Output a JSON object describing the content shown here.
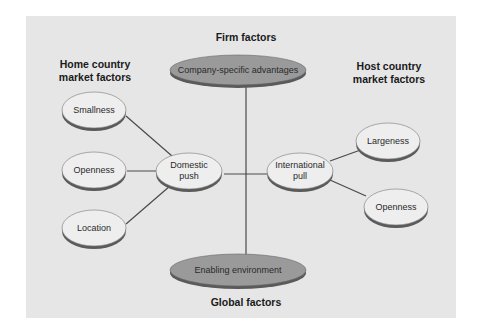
{
  "diagram": {
    "panel_color": "#e6e6e6",
    "light_node_fill": "#eeeeee",
    "dark_node_fill": "#9a9a9a",
    "shadow_color": "#5a5a5a",
    "line_color": "#4a4a4a",
    "titles": {
      "firm": "Firm factors",
      "home_line1": "Home country",
      "home_line2": "market factors",
      "host_line1": "Host country",
      "host_line2": "market factors",
      "global": "Global factors"
    },
    "nodes": {
      "company": "Company-specific advantages",
      "enabling": "Enabling environment",
      "domestic_line1": "Domestic",
      "domestic_line2": "push",
      "international_line1": "International",
      "international_line2": "pull",
      "smallness": "Smallness",
      "openness_home": "Openness",
      "location": "Location",
      "largeness": "Largeness",
      "openness_host": "Openness"
    }
  }
}
